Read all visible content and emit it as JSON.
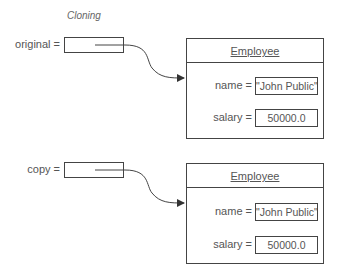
{
  "title": "Cloning",
  "references": [
    {
      "label": "original =",
      "object": {
        "class_name": "Employee",
        "fields": [
          {
            "label": "name =",
            "value": "\"John Public\""
          },
          {
            "label": "salary =",
            "value": "50000.0"
          }
        ]
      }
    },
    {
      "label": "copy =",
      "object": {
        "class_name": "Employee",
        "fields": [
          {
            "label": "name =",
            "value": "\"John Public\""
          },
          {
            "label": "salary =",
            "value": "50000.0"
          }
        ]
      }
    }
  ],
  "colors": {
    "line": "#444444",
    "text": "#555555"
  }
}
